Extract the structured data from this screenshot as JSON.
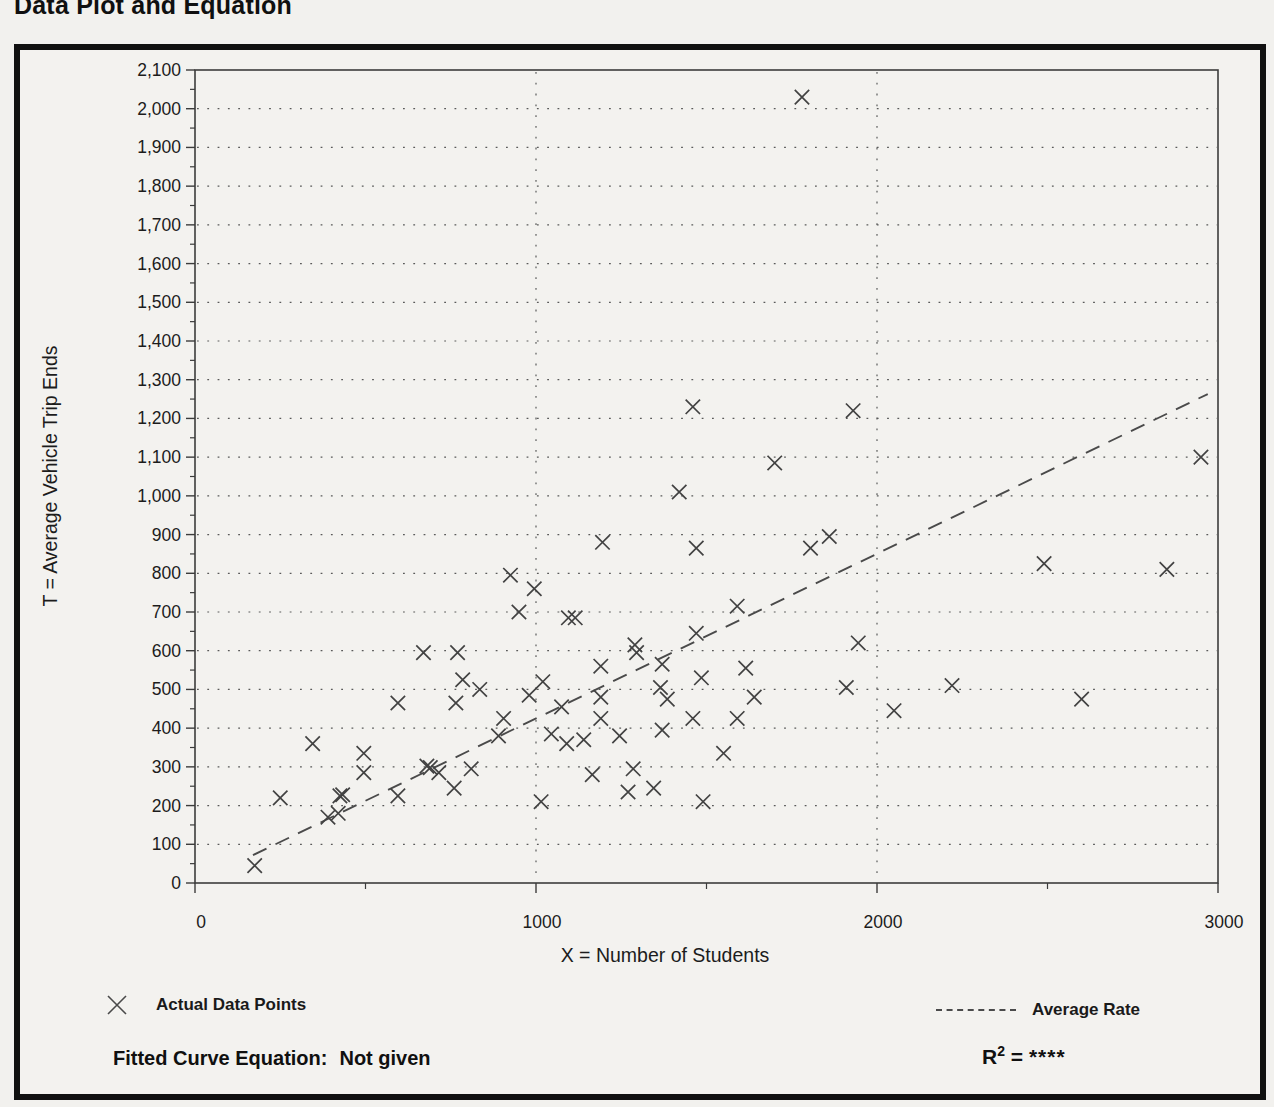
{
  "page": {
    "title": "Data Plot and Equation"
  },
  "chart_data": {
    "type": "scatter",
    "title": "Data Plot and Equation",
    "xlabel": "X = Number of Students",
    "ylabel": "T = Average Vehicle Trip Ends",
    "xlim": [
      0,
      3000
    ],
    "ylim": [
      0,
      2100
    ],
    "x_major_ticks": [
      0,
      1000,
      2000,
      3000
    ],
    "x_minor_ticks": [
      500,
      1500,
      2500
    ],
    "y_tick_step": 100,
    "y_minor_step": 50,
    "grid": {
      "style": "dotted",
      "horizontal_step": 100,
      "vertical_lines": [
        1000,
        2000
      ]
    },
    "legend": [
      {
        "symbol": "x-marker",
        "label": "Actual Data Points"
      },
      {
        "symbol": "dashed-line",
        "label": "Average Rate"
      }
    ],
    "points": [
      [
        175,
        45
      ],
      [
        250,
        220
      ],
      [
        345,
        360
      ],
      [
        390,
        170
      ],
      [
        420,
        180
      ],
      [
        425,
        225
      ],
      [
        433,
        228
      ],
      [
        495,
        285
      ],
      [
        495,
        335
      ],
      [
        595,
        225
      ],
      [
        595,
        465
      ],
      [
        670,
        595
      ],
      [
        680,
        302
      ],
      [
        690,
        298
      ],
      [
        715,
        285
      ],
      [
        760,
        245
      ],
      [
        765,
        465
      ],
      [
        770,
        595
      ],
      [
        785,
        525
      ],
      [
        810,
        295
      ],
      [
        835,
        500
      ],
      [
        890,
        380
      ],
      [
        905,
        425
      ],
      [
        925,
        795
      ],
      [
        950,
        700
      ],
      [
        980,
        485
      ],
      [
        995,
        760
      ],
      [
        1015,
        210
      ],
      [
        1020,
        520
      ],
      [
        1045,
        385
      ],
      [
        1075,
        455
      ],
      [
        1090,
        360
      ],
      [
        1095,
        685
      ],
      [
        1115,
        685
      ],
      [
        1140,
        370
      ],
      [
        1165,
        280
      ],
      [
        1190,
        425
      ],
      [
        1190,
        480
      ],
      [
        1190,
        560
      ],
      [
        1195,
        880
      ],
      [
        1245,
        380
      ],
      [
        1270,
        235
      ],
      [
        1285,
        295
      ],
      [
        1290,
        615
      ],
      [
        1295,
        595
      ],
      [
        1345,
        245
      ],
      [
        1365,
        505
      ],
      [
        1370,
        395
      ],
      [
        1370,
        565
      ],
      [
        1385,
        475
      ],
      [
        1420,
        1010
      ],
      [
        1460,
        425
      ],
      [
        1460,
        1230
      ],
      [
        1470,
        645
      ],
      [
        1470,
        865
      ],
      [
        1485,
        530
      ],
      [
        1490,
        210
      ],
      [
        1550,
        335
      ],
      [
        1590,
        425
      ],
      [
        1590,
        715
      ],
      [
        1615,
        555
      ],
      [
        1640,
        480
      ],
      [
        1700,
        1085
      ],
      [
        1780,
        2030
      ],
      [
        1805,
        865
      ],
      [
        1860,
        895
      ],
      [
        1910,
        505
      ],
      [
        1930,
        1220
      ],
      [
        1945,
        620
      ],
      [
        2050,
        445
      ],
      [
        2220,
        510
      ],
      [
        2490,
        825
      ],
      [
        2600,
        475
      ],
      [
        2850,
        810
      ],
      [
        2950,
        1100
      ]
    ],
    "average_rate_line": {
      "x": [
        170,
        2970
      ],
      "t": [
        72,
        1263
      ]
    },
    "equation": {
      "label": "Fitted Curve Equation:",
      "value": "Not given"
    },
    "r_squared": {
      "base": "R",
      "exponent": "2",
      "equals": " = ",
      "value": "****"
    }
  }
}
